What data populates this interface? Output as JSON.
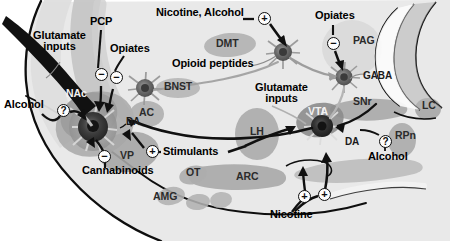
{
  "figure": {
    "type": "brain-sagittal-section-diagram",
    "width": 450,
    "height": 241
  },
  "colors": {
    "background": "#ffffff",
    "brain_fill": "#e9e9e9",
    "nucleus_fill": "#b9b9b9",
    "nucleus_fill_dark": "#a2a2a2",
    "neuron_body": "#8f8f8f",
    "neuron_core": "#4a4a4a",
    "neuron_core_dark": "#2a2a2a",
    "outline": "#111111",
    "label_text": "#000000",
    "region_text": "#2b2b2b",
    "sign_circle_fill": "#fdfdfd",
    "glutamate_track": "#c7c7c7",
    "projection_arrow": "#8a8a8a"
  },
  "drug_labels": [
    {
      "id": "glutamate-inputs-left",
      "text": "Glutamate\ninputs",
      "line1": "Glutamate",
      "line2": "inputs",
      "x": 33,
      "y": 36,
      "multiline": true
    },
    {
      "id": "pcp",
      "text": "PCP",
      "x": 96,
      "y": 22,
      "multiline": false
    },
    {
      "id": "opiates-nac",
      "text": "Opiates",
      "x": 110,
      "y": 48,
      "multiline": false
    },
    {
      "id": "alcohol-nac",
      "text": "Alcohol",
      "x": 6,
      "y": 104,
      "multiline": false
    },
    {
      "id": "cannabinoids",
      "text": "Cannabinoids",
      "x": 83,
      "y": 170,
      "multiline": false
    },
    {
      "id": "stimulants",
      "text": "Stimulants",
      "x": 163,
      "y": 152,
      "multiline": false
    },
    {
      "id": "nicotine-alcohol",
      "text": "Nicotine, Alcohol",
      "x": 157,
      "y": 12,
      "multiline": false
    },
    {
      "id": "opioid-peptides",
      "text": "Opioid peptides",
      "x": 174,
      "y": 62,
      "multiline": false
    },
    {
      "id": "opiates-pag",
      "text": "Opiates",
      "x": 317,
      "y": 14,
      "multiline": false
    },
    {
      "id": "glutamate-inputs-right",
      "text": "Glutamate\ninputs",
      "line1": "Glutamate",
      "line2": "inputs",
      "x": 256,
      "y": 88,
      "multiline": true
    },
    {
      "id": "alcohol-vta",
      "text": "Alcohol",
      "x": 370,
      "y": 156,
      "multiline": false
    },
    {
      "id": "nicotine",
      "text": "Nicotine",
      "x": 272,
      "y": 214,
      "multiline": false
    }
  ],
  "region_labels": [
    {
      "id": "nac",
      "text": "NAc",
      "x": 68,
      "y": 94,
      "light": true
    },
    {
      "id": "ac",
      "text": "AC",
      "x": 141,
      "y": 113,
      "light": false
    },
    {
      "id": "vp",
      "text": "VP",
      "x": 121,
      "y": 156,
      "light": false
    },
    {
      "id": "ot",
      "text": "OT",
      "x": 187,
      "y": 172,
      "light": false
    },
    {
      "id": "amg",
      "text": "AMG",
      "x": 155,
      "y": 196,
      "light": false
    },
    {
      "id": "bnst",
      "text": "BNST",
      "x": 168,
      "y": 85,
      "light": false
    },
    {
      "id": "dmt",
      "text": "DMT",
      "x": 218,
      "y": 42,
      "light": false
    },
    {
      "id": "lh",
      "text": "LH",
      "x": 252,
      "y": 129,
      "light": false
    },
    {
      "id": "arc",
      "text": "ARC",
      "x": 239,
      "y": 176,
      "light": false
    },
    {
      "id": "pag",
      "text": "PAG",
      "x": 355,
      "y": 40,
      "light": false
    },
    {
      "id": "snr",
      "text": "SNr",
      "x": 355,
      "y": 101,
      "light": false
    },
    {
      "id": "vta",
      "text": "VTA",
      "x": 310,
      "y": 112,
      "light": true
    },
    {
      "id": "rpn",
      "text": "RPn",
      "x": 398,
      "y": 136,
      "light": false
    },
    {
      "id": "lc",
      "text": "LC",
      "x": 424,
      "y": 105,
      "light": false
    }
  ],
  "neurotransmitter_labels": [
    {
      "id": "da-nac",
      "text": "DA",
      "x": 126,
      "y": 122
    },
    {
      "id": "da-vta",
      "text": "DA",
      "x": 347,
      "y": 142
    },
    {
      "id": "gaba",
      "text": "GABA",
      "x": 365,
      "y": 77
    }
  ],
  "signs": [
    {
      "id": "sign-pcp",
      "symbol": "−",
      "type": "minus",
      "x": 95,
      "y": 74
    },
    {
      "id": "sign-opiates-nac",
      "symbol": "−",
      "type": "minus",
      "x": 110,
      "y": 77
    },
    {
      "id": "sign-alcohol-nac",
      "symbol": "?",
      "type": "question",
      "x": 57,
      "y": 104
    },
    {
      "id": "sign-cannabinoids",
      "symbol": "−",
      "type": "minus",
      "x": 98,
      "y": 156
    },
    {
      "id": "sign-stimulants",
      "symbol": "+",
      "type": "plus",
      "x": 146,
      "y": 151
    },
    {
      "id": "sign-nicotine-alcohol",
      "symbol": "+",
      "type": "plus",
      "x": 260,
      "y": 17
    },
    {
      "id": "sign-opiates-pag",
      "symbol": "−",
      "type": "minus",
      "x": 327,
      "y": 37
    },
    {
      "id": "sign-alcohol-vta",
      "symbol": "?",
      "type": "question",
      "x": 379,
      "y": 138
    },
    {
      "id": "sign-nicotine-left",
      "symbol": "+",
      "type": "plus",
      "x": 300,
      "y": 194
    },
    {
      "id": "sign-nicotine-right",
      "symbol": "+",
      "type": "plus",
      "x": 320,
      "y": 193
    }
  ],
  "neurons": [
    {
      "id": "neuron-nac",
      "label": "NAc medium spiny neuron",
      "cx": 93,
      "cy": 127,
      "r": 19
    },
    {
      "id": "neuron-bnst",
      "label": "BNST neuron",
      "cx": 145,
      "cy": 88,
      "r": 10
    },
    {
      "id": "neuron-dmt",
      "label": "DMT opioid peptide neuron",
      "cx": 283,
      "cy": 52,
      "r": 10
    },
    {
      "id": "neuron-pag",
      "label": "PAG GABA neuron",
      "cx": 344,
      "cy": 77,
      "r": 9
    },
    {
      "id": "neuron-vta",
      "label": "VTA dopamine neuron",
      "cx": 322,
      "cy": 126,
      "r": 13
    }
  ]
}
